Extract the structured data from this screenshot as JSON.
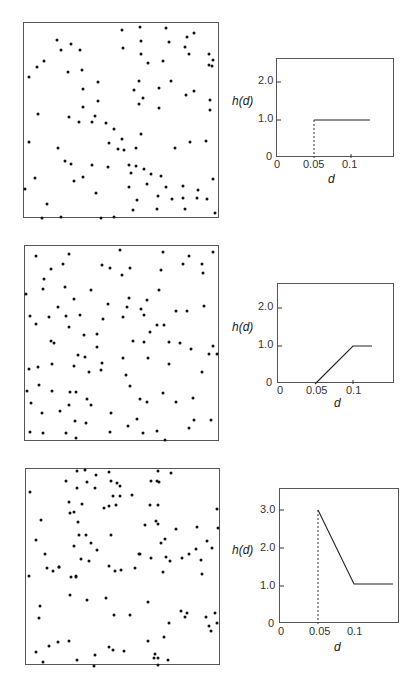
{
  "chart_data": [
    {
      "type": "scatter",
      "title": "",
      "panel": "top-left",
      "description": "Random point pattern (regular / inhibition)",
      "points_px": [
        [
          28,
          76
        ],
        [
          36,
          66
        ],
        [
          43,
          60
        ],
        [
          56,
          39
        ],
        [
          60,
          49
        ],
        [
          70,
          43
        ],
        [
          79,
          49
        ],
        [
          67,
          71
        ],
        [
          81,
          69
        ],
        [
          82,
          88
        ],
        [
          97,
          81
        ],
        [
          82,
          106
        ],
        [
          97,
          100
        ],
        [
          94,
          115
        ],
        [
          121,
          29
        ],
        [
          122,
          47
        ],
        [
          139,
          26
        ],
        [
          140,
          40
        ],
        [
          165,
          27
        ],
        [
          168,
          41
        ],
        [
          186,
          36
        ],
        [
          193,
          32
        ],
        [
          140,
          53
        ],
        [
          147,
          62
        ],
        [
          162,
          60
        ],
        [
          184,
          46
        ],
        [
          188,
          53
        ],
        [
          208,
          53
        ],
        [
          212,
          59
        ],
        [
          211,
          65
        ],
        [
          208,
          64
        ],
        [
          138,
          80
        ],
        [
          133,
          89
        ],
        [
          142,
          97
        ],
        [
          158,
          87
        ],
        [
          170,
          80
        ],
        [
          185,
          94
        ],
        [
          193,
          90
        ],
        [
          209,
          99
        ],
        [
          209,
          109
        ],
        [
          138,
          103
        ],
        [
          158,
          107
        ],
        [
          37,
          113
        ],
        [
          68,
          116
        ],
        [
          78,
          121
        ],
        [
          91,
          121
        ],
        [
          105,
          122
        ],
        [
          108,
          142
        ],
        [
          113,
          128
        ],
        [
          121,
          138
        ],
        [
          123,
          149
        ],
        [
          117,
          148
        ],
        [
          135,
          147
        ],
        [
          140,
          133
        ],
        [
          128,
          164
        ],
        [
          135,
          165
        ],
        [
          143,
          168
        ],
        [
          150,
          173
        ],
        [
          160,
          175
        ],
        [
          174,
          147
        ],
        [
          189,
          141
        ],
        [
          205,
          140
        ],
        [
          28,
          141
        ],
        [
          57,
          147
        ],
        [
          64,
          160
        ],
        [
          70,
          163
        ],
        [
          73,
          180
        ],
        [
          82,
          176
        ],
        [
          91,
          164
        ],
        [
          95,
          192
        ],
        [
          107,
          166
        ],
        [
          130,
          172
        ],
        [
          128,
          186
        ],
        [
          146,
          183
        ],
        [
          165,
          186
        ],
        [
          24,
          188
        ],
        [
          34,
          177
        ],
        [
          46,
          203
        ],
        [
          41,
          217
        ],
        [
          60,
          216
        ],
        [
          100,
          217
        ],
        [
          113,
          216
        ],
        [
          132,
          209
        ],
        [
          136,
          199
        ],
        [
          157,
          195
        ],
        [
          171,
          198
        ],
        [
          182,
          185
        ],
        [
          182,
          197
        ],
        [
          196,
          197
        ],
        [
          206,
          198
        ],
        [
          212,
          178
        ],
        [
          214,
          212
        ],
        [
          156,
          208
        ],
        [
          184,
          208
        ],
        [
          197,
          189
        ]
      ],
      "xlim": [
        0,
        1
      ],
      "ylim": [
        0,
        1
      ]
    },
    {
      "type": "line",
      "panel": "top-right",
      "title": "",
      "xlabel": "d",
      "ylabel": "h(d)",
      "x_ticks": [
        "0",
        "0.05",
        "0.1"
      ],
      "y_ticks": [
        "0",
        "1.0",
        "2.0"
      ],
      "xlim": [
        0,
        0.15
      ],
      "ylim": [
        0,
        2.6
      ],
      "series": [
        {
          "name": "h(d)",
          "style": "solid",
          "x": [
            0.05,
            0.05,
            0.125
          ],
          "y": [
            0,
            1.0,
            1.0
          ]
        },
        {
          "name": "discontinuity",
          "style": "dashed",
          "x": [
            0.05,
            0.05
          ],
          "y": [
            0,
            1.0
          ]
        }
      ]
    },
    {
      "type": "scatter",
      "panel": "middle-left",
      "description": "Random point pattern (soft inhibition)",
      "points_px": [
        [
          35,
          255
        ],
        [
          68,
          253
        ],
        [
          119,
          249
        ],
        [
          162,
          251
        ],
        [
          188,
          255
        ],
        [
          212,
          251
        ],
        [
          50,
          268
        ],
        [
          62,
          263
        ],
        [
          101,
          264
        ],
        [
          109,
          267
        ],
        [
          129,
          267
        ],
        [
          160,
          269
        ],
        [
          182,
          263
        ],
        [
          201,
          263
        ],
        [
          202,
          272
        ],
        [
          43,
          278
        ],
        [
          121,
          274
        ],
        [
          42,
          288
        ],
        [
          64,
          286
        ],
        [
          90,
          289
        ],
        [
          128,
          297
        ],
        [
          158,
          289
        ],
        [
          126,
          306
        ],
        [
          146,
          299
        ],
        [
          203,
          305
        ],
        [
          25,
          293
        ],
        [
          73,
          298
        ],
        [
          57,
          306
        ],
        [
          107,
          303
        ],
        [
          140,
          308
        ],
        [
          29,
          315
        ],
        [
          48,
          316
        ],
        [
          65,
          315
        ],
        [
          79,
          314
        ],
        [
          102,
          318
        ],
        [
          122,
          316
        ],
        [
          143,
          314
        ],
        [
          156,
          324
        ],
        [
          186,
          310
        ],
        [
          163,
          324
        ],
        [
          175,
          310
        ],
        [
          35,
          323
        ],
        [
          68,
          326
        ],
        [
          83,
          334
        ],
        [
          96,
          333
        ],
        [
          50,
          340
        ],
        [
          53,
          342
        ],
        [
          77,
          354
        ],
        [
          84,
          356
        ],
        [
          96,
          346
        ],
        [
          101,
          362
        ],
        [
          122,
          357
        ],
        [
          132,
          340
        ],
        [
          143,
          341
        ],
        [
          149,
          331
        ],
        [
          168,
          341
        ],
        [
          179,
          342
        ],
        [
          190,
          348
        ],
        [
          212,
          345
        ],
        [
          216,
          353
        ],
        [
          28,
          368
        ],
        [
          37,
          366
        ],
        [
          51,
          363
        ],
        [
          73,
          365
        ],
        [
          88,
          371
        ],
        [
          100,
          369
        ],
        [
          125,
          374
        ],
        [
          147,
          357
        ],
        [
          168,
          363
        ],
        [
          201,
          371
        ],
        [
          208,
          353
        ],
        [
          26,
          390
        ],
        [
          38,
          384
        ],
        [
          51,
          390
        ],
        [
          69,
          391
        ],
        [
          75,
          391
        ],
        [
          90,
          404
        ],
        [
          86,
          398
        ],
        [
          129,
          385
        ],
        [
          139,
          398
        ],
        [
          146,
          401
        ],
        [
          162,
          392
        ],
        [
          175,
          401
        ],
        [
          192,
          397
        ],
        [
          193,
          419
        ],
        [
          210,
          419
        ],
        [
          30,
          402
        ],
        [
          41,
          412
        ],
        [
          59,
          410
        ],
        [
          68,
          404
        ],
        [
          85,
          422
        ],
        [
          110,
          412
        ],
        [
          74,
          420
        ],
        [
          127,
          425
        ],
        [
          136,
          418
        ],
        [
          188,
          427
        ],
        [
          29,
          431
        ],
        [
          42,
          432
        ],
        [
          65,
          432
        ],
        [
          75,
          437
        ],
        [
          109,
          431
        ],
        [
          142,
          432
        ],
        [
          156,
          430
        ],
        [
          164,
          439
        ]
      ],
      "xlim": [
        0,
        1
      ],
      "ylim": [
        0,
        1
      ]
    },
    {
      "type": "line",
      "panel": "middle-right",
      "title": "",
      "xlabel": "d",
      "ylabel": "h(d)",
      "x_ticks": [
        "0",
        "0.05",
        "0.1"
      ],
      "y_ticks": [
        "0",
        "1.0",
        "2.0"
      ],
      "xlim": [
        0,
        0.15
      ],
      "ylim": [
        0,
        2.6
      ],
      "series": [
        {
          "name": "h(d)",
          "style": "solid",
          "x": [
            0.05,
            0.1,
            0.125
          ],
          "y": [
            0,
            1.0,
            1.0
          ]
        }
      ]
    },
    {
      "type": "scatter",
      "panel": "bottom-left",
      "description": "Clustered point pattern",
      "points_px": [
        [
          76,
          470
        ],
        [
          84,
          469
        ],
        [
          95,
          474
        ],
        [
          108,
          471
        ],
        [
          116,
          482
        ],
        [
          157,
          470
        ],
        [
          170,
          472
        ],
        [
          29,
          491
        ],
        [
          65,
          480
        ],
        [
          76,
          487
        ],
        [
          86,
          481
        ],
        [
          94,
          487
        ],
        [
          110,
          480
        ],
        [
          119,
          485
        ],
        [
          112,
          495
        ],
        [
          150,
          480
        ],
        [
          156,
          480
        ],
        [
          158,
          481
        ],
        [
          68,
          501
        ],
        [
          81,
          503
        ],
        [
          108,
          505
        ],
        [
          119,
          495
        ],
        [
          131,
          494
        ],
        [
          69,
          512
        ],
        [
          73,
          511
        ],
        [
          103,
          507
        ],
        [
          115,
          504
        ],
        [
          149,
          504
        ],
        [
          157,
          504
        ],
        [
          216,
          508
        ],
        [
          40,
          519
        ],
        [
          77,
          521
        ],
        [
          157,
          523
        ],
        [
          78,
          534
        ],
        [
          85,
          534
        ],
        [
          110,
          534
        ],
        [
          155,
          520
        ],
        [
          144,
          524
        ],
        [
          175,
          528
        ],
        [
          35,
          539
        ],
        [
          90,
          542
        ],
        [
          73,
          545
        ],
        [
          96,
          549
        ],
        [
          139,
          553
        ],
        [
          160,
          542
        ],
        [
          164,
          538
        ],
        [
          196,
          526
        ],
        [
          217,
          527
        ],
        [
          206,
          540
        ],
        [
          211,
          547
        ],
        [
          44,
          553
        ],
        [
          52,
          570
        ],
        [
          58,
          566
        ],
        [
          80,
          558
        ],
        [
          88,
          560
        ],
        [
          120,
          569
        ],
        [
          134,
          567
        ],
        [
          138,
          553
        ],
        [
          150,
          557
        ],
        [
          169,
          560
        ],
        [
          188,
          553
        ],
        [
          195,
          548
        ],
        [
          28,
          575
        ],
        [
          46,
          567
        ],
        [
          58,
          566
        ],
        [
          70,
          576
        ],
        [
          75,
          576
        ],
        [
          108,
          565
        ],
        [
          114,
          570
        ],
        [
          165,
          556
        ],
        [
          181,
          557
        ],
        [
          200,
          559
        ],
        [
          39,
          605
        ],
        [
          38,
          617
        ],
        [
          75,
          575
        ],
        [
          69,
          594
        ],
        [
          86,
          599
        ],
        [
          105,
          597
        ],
        [
          113,
          614
        ],
        [
          129,
          614
        ],
        [
          147,
          601
        ],
        [
          162,
          571
        ],
        [
          201,
          573
        ],
        [
          186,
          612
        ],
        [
          205,
          616
        ],
        [
          48,
          645
        ],
        [
          57,
          641
        ],
        [
          68,
          640
        ],
        [
          76,
          659
        ],
        [
          94,
          654
        ],
        [
          108,
          646
        ],
        [
          112,
          649
        ],
        [
          147,
          640
        ],
        [
          163,
          636
        ],
        [
          180,
          610
        ],
        [
          184,
          616
        ],
        [
          214,
          612
        ],
        [
          216,
          622
        ],
        [
          35,
          651
        ],
        [
          42,
          661
        ],
        [
          93,
          665
        ],
        [
          123,
          650
        ],
        [
          154,
          653
        ],
        [
          157,
          657
        ],
        [
          153,
          657
        ],
        [
          157,
          664
        ],
        [
          167,
          659
        ],
        [
          168,
          622
        ],
        [
          208,
          625
        ],
        [
          210,
          630
        ]
      ],
      "xlim": [
        0,
        1
      ],
      "ylim": [
        0,
        1
      ]
    },
    {
      "type": "line",
      "panel": "bottom-right",
      "title": "",
      "xlabel": "d",
      "ylabel": "h(d)",
      "x_ticks": [
        "0",
        "0.05",
        "0.1"
      ],
      "y_ticks": [
        "0",
        "1.0",
        "2.0",
        "3.0"
      ],
      "xlim": [
        0,
        0.15
      ],
      "ylim": [
        0,
        3.5
      ],
      "series": [
        {
          "name": "h(d)",
          "style": "solid",
          "x": [
            0.05,
            0.1,
            0.145
          ],
          "y": [
            3.0,
            1.05,
            1.05
          ]
        },
        {
          "name": "discontinuity",
          "style": "dashed",
          "x": [
            0.05,
            0.05
          ],
          "y": [
            0,
            3.0
          ]
        }
      ]
    }
  ],
  "labels": {
    "ylabel": "h(d)",
    "xlabel": "d",
    "tick_0": "0",
    "tick_005": "0.05",
    "tick_01": "0.1",
    "tick_10": "1.0",
    "tick_20": "2.0",
    "tick_30": "3.0"
  }
}
